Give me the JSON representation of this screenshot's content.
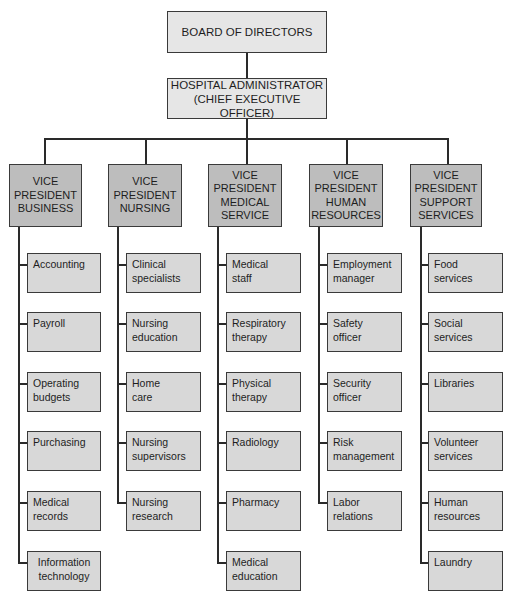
{
  "chart_data": {
    "type": "org_chart",
    "root": {
      "label": "BOARD OF DIRECTORS",
      "children": [
        {
          "label": "HOSPITAL ADMINISTRATOR (CHIEF EXECUTIVE OFFICER)",
          "children": [
            {
              "label": "VICE PRESIDENT BUSINESS",
              "children": [
                "Accounting",
                "Payroll",
                "Operating budgets",
                "Purchasing",
                "Medical records",
                "Information technology"
              ]
            },
            {
              "label": "VICE PRESIDENT NURSING",
              "children": [
                "Clinical specialists",
                "Nursing education",
                "Home care",
                "Nursing supervisors",
                "Nursing research"
              ]
            },
            {
              "label": "VICE PRESIDENT MEDICAL SERVICE",
              "children": [
                "Medical staff",
                "Respiratory therapy",
                "Physical therapy",
                "Radiology",
                "Pharmacy",
                "Medical education"
              ]
            },
            {
              "label": "VICE PRESIDENT HUMAN RESOURCES",
              "children": [
                "Employment manager",
                "Safety officer",
                "Security officer",
                "Risk management",
                "Labor relations"
              ]
            },
            {
              "label": "VICE PRESIDENT SUPPORT SERVICES",
              "children": [
                "Food services",
                "Social services",
                "Libraries",
                "Volunteer services",
                "Human resources",
                "Laundry"
              ]
            }
          ]
        }
      ]
    }
  },
  "board": {
    "line1": "BOARD OF DIRECTORS"
  },
  "admin": {
    "line1": "HOSPITAL ADMINISTRATOR",
    "line2": "(CHIEF EXECUTIVE OFFICER)"
  },
  "vps": [
    {
      "lines": [
        "VICE",
        "PRESIDENT",
        "BUSINESS"
      ],
      "children": [
        [
          "Accounting"
        ],
        [
          "Payroll"
        ],
        [
          "Operating",
          "budgets"
        ],
        [
          "Purchasing"
        ],
        [
          "Medical",
          "records"
        ],
        [
          "Information",
          "technology"
        ]
      ]
    },
    {
      "lines": [
        "VICE",
        "PRESIDENT",
        "NURSING"
      ],
      "children": [
        [
          "Clinical",
          "specialists"
        ],
        [
          "Nursing",
          "education"
        ],
        [
          "Home",
          "care"
        ],
        [
          "Nursing",
          "supervisors"
        ],
        [
          "Nursing",
          "research"
        ]
      ]
    },
    {
      "lines": [
        "VICE",
        "PRESIDENT",
        "MEDICAL",
        "SERVICE"
      ],
      "children": [
        [
          "Medical",
          "staff"
        ],
        [
          "Respiratory",
          "therapy"
        ],
        [
          "Physical",
          "therapy"
        ],
        [
          "Radiology"
        ],
        [
          "Pharmacy"
        ],
        [
          "Medical",
          "education"
        ]
      ]
    },
    {
      "lines": [
        "VICE",
        "PRESIDENT",
        "HUMAN",
        "RESOURCES"
      ],
      "children": [
        [
          "Employment",
          "manager"
        ],
        [
          "Safety",
          "officer"
        ],
        [
          "Security",
          "officer"
        ],
        [
          "Risk",
          "management"
        ],
        [
          "Labor",
          "relations"
        ]
      ]
    },
    {
      "lines": [
        "VICE",
        "PRESIDENT",
        "SUPPORT",
        "SERVICES"
      ],
      "children": [
        [
          "Food",
          "services"
        ],
        [
          "Social",
          "services"
        ],
        [
          "Libraries"
        ],
        [
          "Volunteer",
          "services"
        ],
        [
          "Human",
          "resources"
        ],
        [
          "Laundry"
        ]
      ]
    }
  ]
}
